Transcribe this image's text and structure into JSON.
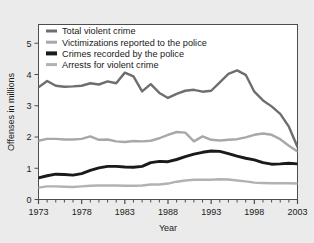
{
  "chart_data": {
    "type": "line",
    "title": "",
    "xlabel": "Year",
    "ylabel": "Offenses in millions",
    "xlim": [
      1973,
      2003
    ],
    "ylim": [
      0,
      5.6
    ],
    "grid": false,
    "legend_position": "top-left",
    "yticks": [
      0,
      1,
      2,
      3,
      4,
      5
    ],
    "ytick_labels": [
      "0",
      "1",
      "2",
      "3",
      "4",
      "5"
    ],
    "xticks": [
      1973,
      1978,
      1983,
      1988,
      1993,
      1998,
      2003
    ],
    "xtick_labels": [
      "1973",
      "1978",
      "1983",
      "1988",
      "1993",
      "1998",
      "2003"
    ],
    "x": [
      1973,
      1974,
      1975,
      1976,
      1977,
      1978,
      1979,
      1980,
      1981,
      1982,
      1983,
      1984,
      1985,
      1986,
      1987,
      1988,
      1989,
      1990,
      1991,
      1992,
      1993,
      1994,
      1995,
      1996,
      1997,
      1998,
      1999,
      2000,
      2001,
      2002,
      2003
    ],
    "series": [
      {
        "name": "Total violent crime",
        "color": "#6e6e6e",
        "width": 2.4,
        "values": [
          3.59,
          3.79,
          3.64,
          3.61,
          3.62,
          3.64,
          3.72,
          3.68,
          3.78,
          3.72,
          4.06,
          3.94,
          3.46,
          3.69,
          3.41,
          3.25,
          3.38,
          3.48,
          3.51,
          3.45,
          3.48,
          3.75,
          4.02,
          4.13,
          3.99,
          3.45,
          3.17,
          2.98,
          2.74,
          2.33,
          1.68
        ]
      },
      {
        "name": "Victimizations reported to the police",
        "color": "#a8a8a8",
        "width": 2.4,
        "values": [
          1.88,
          1.94,
          1.94,
          1.92,
          1.92,
          1.94,
          2.02,
          1.91,
          1.92,
          1.86,
          1.84,
          1.87,
          1.86,
          1.88,
          1.96,
          2.07,
          2.16,
          2.14,
          1.86,
          2.02,
          1.91,
          1.89,
          1.91,
          1.93,
          1.99,
          2.07,
          2.11,
          2.07,
          1.93,
          1.72,
          1.54
        ]
      },
      {
        "name": "Crimes recorded by the police",
        "color": "#1a1a1a",
        "width": 2.9,
        "values": [
          0.69,
          0.76,
          0.81,
          0.8,
          0.78,
          0.83,
          0.93,
          1.01,
          1.06,
          1.06,
          1.04,
          1.03,
          1.06,
          1.18,
          1.22,
          1.21,
          1.28,
          1.37,
          1.45,
          1.51,
          1.55,
          1.54,
          1.47,
          1.39,
          1.32,
          1.27,
          1.18,
          1.13,
          1.14,
          1.16,
          1.14
        ]
      },
      {
        "name": "Arrests for violent crime",
        "color": "#b2b2b2",
        "width": 2.4,
        "values": [
          0.38,
          0.42,
          0.42,
          0.41,
          0.4,
          0.42,
          0.44,
          0.45,
          0.45,
          0.45,
          0.44,
          0.44,
          0.45,
          0.48,
          0.48,
          0.51,
          0.57,
          0.61,
          0.63,
          0.63,
          0.63,
          0.65,
          0.64,
          0.61,
          0.58,
          0.54,
          0.53,
          0.52,
          0.52,
          0.52,
          0.51
        ]
      }
    ]
  },
  "legend": {
    "items": [
      {
        "label": "Total violent crime",
        "color": "#6e6e6e",
        "thickness": 3
      },
      {
        "label": "Victimizations reported to the police",
        "color": "#a8a8a8",
        "thickness": 3
      },
      {
        "label": "Crimes recorded by the police",
        "color": "#1a1a1a",
        "thickness": 4
      },
      {
        "label": "Arrests for violent crime",
        "color": "#b2b2b2",
        "thickness": 3
      }
    ]
  },
  "colors": {
    "background": "#ebebeb",
    "plot_background": "#ffffff",
    "frame": "#4d4d4d",
    "text": "#1a1a1a"
  }
}
